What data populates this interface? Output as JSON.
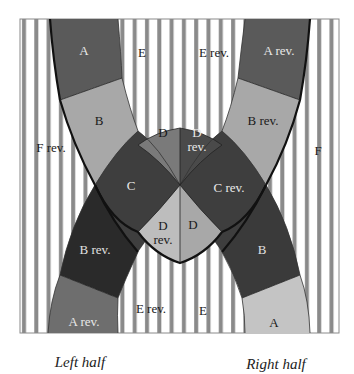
{
  "diagram": {
    "type": "strip-crossing-diagram",
    "colors": {
      "stripe": "#8a8a8a",
      "background": "#ffffff",
      "dark": "#3e3e3e",
      "darkest": "#2a2a2a",
      "mid_dark": "#5a5a5a",
      "mid": "#7a7a7a",
      "light": "#a8a8a8",
      "lighter": "#c4c4c4",
      "outline": "#111111",
      "label_light": "#e8e8e8",
      "label_dark": "#1a1a1a"
    },
    "regions": {
      "A_top_left": "A",
      "B_left": "B",
      "D_top_left": "D",
      "D_rev_top_right": "D rev.",
      "C_left": "C",
      "C_rev_right": "C rev.",
      "D_rev_bottom_left": "D rev.",
      "D_bottom_right": "D",
      "B_rev_left": "B rev.",
      "A_rev_bottom_left": "A rev.",
      "E_top": "E",
      "E_rev_top": "E rev.",
      "A_rev_top_right": "A rev.",
      "B_rev_right": "B rev.",
      "F_rev": "F rev.",
      "F": "F",
      "B_right": "B",
      "A_bottom_right": "A",
      "E_rev_bottom": "E rev.",
      "E_bottom": "E"
    },
    "captions": {
      "left": "Left half",
      "right": "Right half"
    }
  }
}
